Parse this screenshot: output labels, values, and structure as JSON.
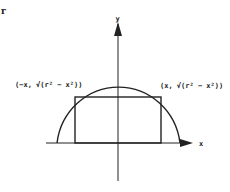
{
  "figure": {
    "corner_label": "r",
    "axes": {
      "x_label": "x",
      "y_label": "y"
    },
    "points": {
      "left": "(−x, √(r² − x²))",
      "right": "(x, √(r² − x²))"
    },
    "shapes": [
      "semicircle of radius r centered at origin",
      "inscribed rectangle"
    ],
    "colors": {
      "stroke": "#222222",
      "background": "#ffffff"
    }
  }
}
